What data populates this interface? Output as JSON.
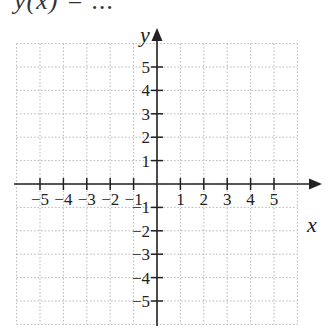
{
  "header": {
    "text": "y(x)  =  ..."
  },
  "graph": {
    "x_axis_label": "x",
    "y_axis_label": "y",
    "x_ticks": [
      "−5",
      "−4",
      "−3",
      "−2",
      "−1",
      "1",
      "2",
      "3",
      "4",
      "5"
    ],
    "y_ticks": [
      "5",
      "4",
      "3",
      "2",
      "1",
      "−1",
      "−2",
      "−3",
      "−4",
      "−5"
    ],
    "x_range": [
      -6,
      6
    ],
    "y_range": [
      -6,
      6
    ],
    "grid": "dotted"
  }
}
